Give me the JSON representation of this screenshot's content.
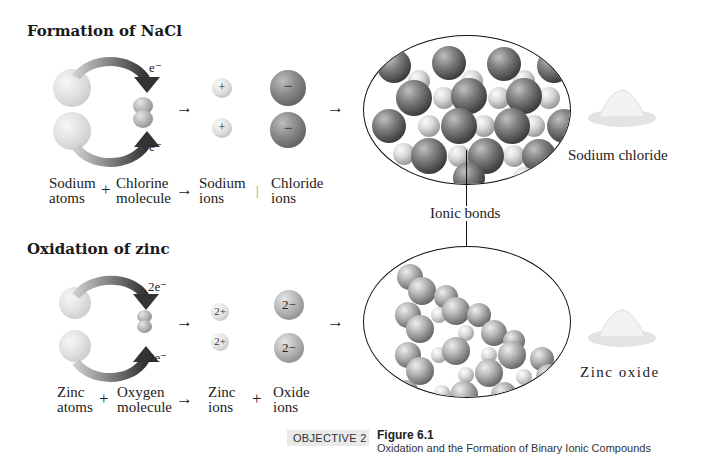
{
  "figure": {
    "number": "Figure 6.1",
    "caption": "Oxidation and the Formation of Binary Ionic Compounds",
    "objective": "Objective 2",
    "objective_display": "OBJECTIVE 2"
  },
  "nacl": {
    "title": "Formation of NaCl",
    "electron_label": "e⁻",
    "cation_charge": "+",
    "anion_charge": "−",
    "reactant1": [
      "Sodium",
      "atoms"
    ],
    "reactant2": [
      "Chlorine",
      "molecule"
    ],
    "product1": [
      "Sodium",
      "ions"
    ],
    "product2": [
      "Chloride",
      "ions"
    ],
    "product_name": "Sodium chloride",
    "plus": "+",
    "arrow": "→",
    "product_plus": "|"
  },
  "zno": {
    "title": "Oxidation of zinc",
    "electron_label": "2e⁻",
    "cation_charge": "2+",
    "anion_charge": "2−",
    "reactant1": [
      "Zinc",
      "atoms"
    ],
    "reactant2": [
      "Oxygen",
      "molecule"
    ],
    "product1": [
      "Zinc",
      "ions"
    ],
    "product2": [
      "Oxide",
      "ions"
    ],
    "product_name": "Zinc oxide",
    "plus": "+",
    "arrow": "→"
  },
  "shared": {
    "bond_label": "Ionic bonds"
  }
}
